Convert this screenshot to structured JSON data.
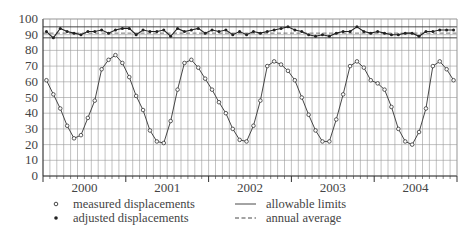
{
  "chart_data": {
    "type": "line",
    "title": "",
    "xlabel": "",
    "ylabel": "",
    "ylim": [
      0,
      100
    ],
    "yticks": [
      "0",
      "10",
      "20",
      "30",
      "40",
      "50",
      "60",
      "70",
      "80",
      "90",
      "100"
    ],
    "xlim": [
      2000,
      2005
    ],
    "xtick_labels": [
      "2000",
      "2001",
      "2002",
      "2003",
      "2004"
    ],
    "grid": "monthly vertical + every 10 horizontal",
    "legend_position": "bottom",
    "legend": [
      {
        "label": "measured displacements",
        "marker": "open-circle"
      },
      {
        "label": "adjusted displacements",
        "marker": "filled-dot"
      },
      {
        "label": "allowable limits",
        "style": "solid-line"
      },
      {
        "label": "annual average",
        "style": "dashed-line"
      }
    ],
    "allowable_limits": [
      88,
      95
    ],
    "annual_average": 91,
    "series": [
      {
        "name": "measured displacements",
        "x_months": [
          0,
          1,
          2,
          3,
          4,
          5,
          6,
          7,
          8,
          9,
          10,
          11,
          12,
          13,
          14,
          15,
          16,
          17,
          18,
          19,
          20,
          21,
          22,
          23,
          24,
          25,
          26,
          27,
          28,
          29,
          30,
          31,
          32,
          33,
          34,
          35,
          36,
          37,
          38,
          39,
          40,
          41,
          42,
          43,
          44,
          45,
          46,
          47,
          48,
          49,
          50,
          51,
          52,
          53,
          54,
          55,
          56,
          57,
          58,
          59
        ],
        "values": [
          61,
          52,
          43,
          32,
          24,
          26,
          37,
          48,
          68,
          74,
          77,
          72,
          63,
          51,
          42,
          29,
          22,
          21,
          35,
          55,
          72,
          74,
          69,
          62,
          55,
          47,
          40,
          30,
          23,
          22,
          32,
          48,
          70,
          73,
          71,
          67,
          61,
          50,
          39,
          29,
          22,
          22,
          36,
          52,
          70,
          73,
          69,
          61,
          59,
          55,
          44,
          30,
          22,
          20,
          28,
          43,
          70,
          73,
          68,
          61
        ]
      },
      {
        "name": "adjusted displacements",
        "x_months": [
          0,
          1,
          2,
          3,
          4,
          5,
          6,
          7,
          8,
          9,
          10,
          11,
          12,
          13,
          14,
          15,
          16,
          17,
          18,
          19,
          20,
          21,
          22,
          23,
          24,
          25,
          26,
          27,
          28,
          29,
          30,
          31,
          32,
          33,
          34,
          35,
          36,
          37,
          38,
          39,
          40,
          41,
          42,
          43,
          44,
          45,
          46,
          47,
          48,
          49,
          50,
          51,
          52,
          53,
          54,
          55,
          56,
          57,
          58,
          59
        ],
        "values": [
          92,
          88,
          94,
          92,
          91,
          90,
          92,
          92,
          93,
          91,
          93,
          94,
          94,
          90,
          93,
          92,
          92,
          93,
          89,
          94,
          92,
          93,
          94,
          91,
          93,
          92,
          93,
          90,
          92,
          90,
          92,
          91,
          92,
          93,
          94,
          95,
          93,
          92,
          90,
          89,
          90,
          89,
          91,
          92,
          92,
          95,
          92,
          91,
          92,
          91,
          90,
          90,
          91,
          91,
          89,
          92,
          92,
          93,
          93,
          93
        ],
        "color": "#222222"
      }
    ]
  }
}
